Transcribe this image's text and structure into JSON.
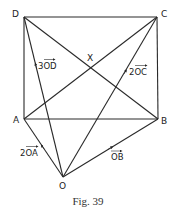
{
  "diagram": {
    "points": {
      "A": {
        "label": "A",
        "x": 24,
        "y": 119
      },
      "B": {
        "label": "B",
        "x": 158,
        "y": 119
      },
      "C": {
        "label": "C",
        "x": 157,
        "y": 17
      },
      "D": {
        "label": "D",
        "x": 24,
        "y": 17
      },
      "O": {
        "label": "O",
        "x": 63,
        "y": 177
      },
      "X": {
        "label": "X",
        "x": 91,
        "y": 67
      }
    },
    "vector_labels": {
      "OD": "3OD",
      "OC": "2OC",
      "OA": "2OA",
      "OB": "OB"
    },
    "segments": [
      "AB",
      "BC",
      "CD",
      "DA",
      "AC",
      "BD",
      "OA",
      "OB",
      "OC",
      "OD"
    ],
    "caption": "Fig. 39"
  }
}
